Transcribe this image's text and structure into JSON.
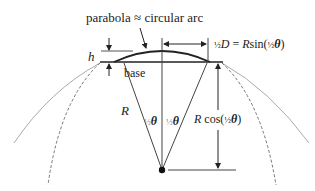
{
  "diagram": {
    "title_label": "parabola ≈ circular arc",
    "h_label": "h",
    "base_label": "base",
    "half_d_label": {
      "frac": "½",
      "D": "D",
      "eq": " = ",
      "R": "R",
      "func": "sin(",
      "frac2": "½",
      "theta": "θ",
      "close": ")"
    },
    "radius_label": "R",
    "half_theta_left": {
      "frac": "½",
      "theta": "θ"
    },
    "half_theta_right": {
      "frac": "½",
      "theta": "θ"
    },
    "cos_label": {
      "R": "R",
      "func": " cos(",
      "frac": "½",
      "theta": "θ",
      "close": ")"
    },
    "colors": {
      "line": "#222222",
      "gray": "#999999",
      "dashed": "#777777"
    }
  }
}
